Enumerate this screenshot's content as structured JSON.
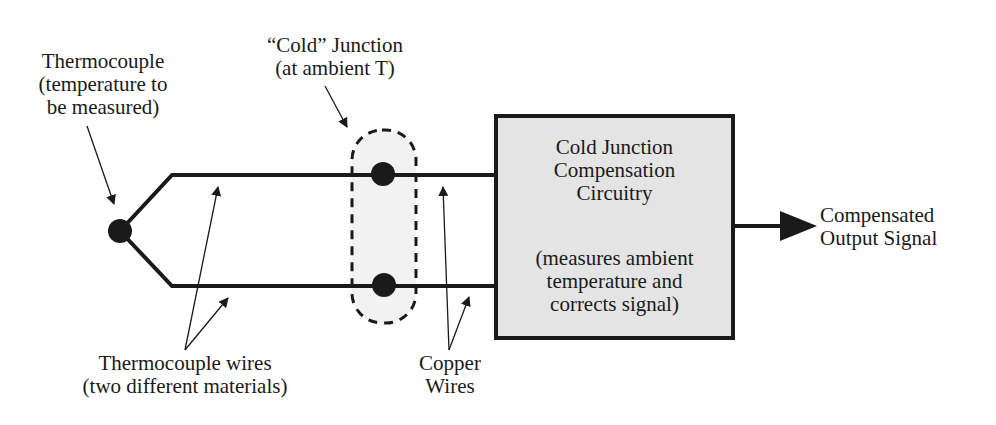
{
  "diagram": {
    "labels": {
      "thermocouple": [
        "Thermocouple",
        "(temperature to",
        "be measured)"
      ],
      "cold_junction": [
        "“Cold” Junction",
        "(at ambient T)"
      ],
      "thermocouple_wires": [
        "Thermocouple wires",
        "(two different materials)"
      ],
      "copper_wires": [
        "Copper",
        "Wires"
      ],
      "output": [
        "Compensated",
        "Output Signal"
      ]
    },
    "box": {
      "title": [
        "Cold Junction",
        "Compensation",
        "Circuitry"
      ],
      "description": [
        "(measures ambient",
        "temperature and",
        "corrects signal)"
      ],
      "fill": "#e4e4e4"
    },
    "colors": {
      "line": "#1a1a1a",
      "background": "#ffffff",
      "cold_fill": "#f2f2f2"
    }
  }
}
